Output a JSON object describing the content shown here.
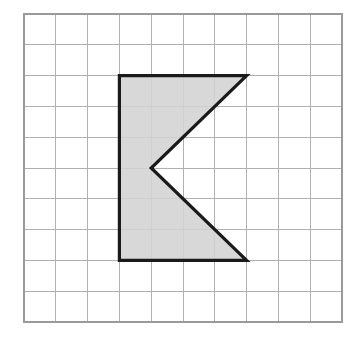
{
  "figure": {
    "background_color": "#ffffff"
  },
  "grid": {
    "name": "square-grid",
    "columns": 10,
    "rows": 10,
    "origin_x": 24,
    "origin_y": 14,
    "cell_width": 31.8,
    "cell_height": 30.8,
    "line_color": "#b0b0b0",
    "border_color": "#9a9a9a",
    "line_width": 1,
    "border_width": 1.4,
    "cell_fill": "#ffffff"
  },
  "shape": {
    "name": "chevron-pentagon",
    "label": "Shaded arrow-head polygon",
    "vertex_count": 5,
    "vertices_grid": [
      {
        "col": 3,
        "row": 2
      },
      {
        "col": 7,
        "row": 2
      },
      {
        "col": 4,
        "row": 5
      },
      {
        "col": 7,
        "row": 8
      },
      {
        "col": 3,
        "row": 8
      }
    ],
    "vertices_px": [
      {
        "x": 119.4,
        "y": 75.6
      },
      {
        "x": 246.6,
        "y": 75.6
      },
      {
        "x": 151.2,
        "y": 168.0
      },
      {
        "x": 246.6,
        "y": 260.4
      },
      {
        "x": 119.4,
        "y": 260.4
      }
    ],
    "fill_color": "#d3d3d3",
    "fill_opacity": 0.88,
    "stroke_color": "#1a1a1a",
    "stroke_width": 3.2,
    "width_cells": 4,
    "height_cells": 6
  }
}
